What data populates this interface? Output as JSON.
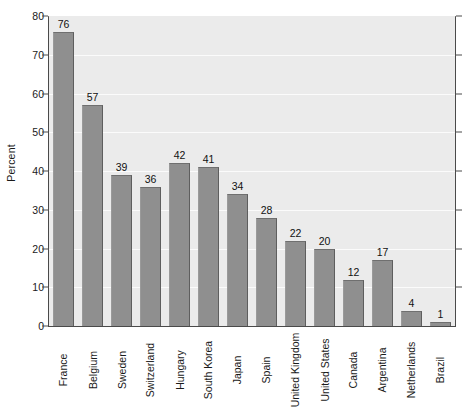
{
  "chart_data": {
    "type": "bar",
    "title": "",
    "subtitle": "",
    "xlabel": "",
    "ylabel": "Percent",
    "ylim": [
      0,
      80
    ],
    "yticks": [
      0,
      10,
      20,
      30,
      40,
      50,
      60,
      70,
      80
    ],
    "grid": true,
    "legend": null,
    "orientation": "vertical",
    "bar_color": "#8f8f8f",
    "plot_background": "#ebebeb",
    "gridline_color": "#fbfbfb",
    "axis_color": "#4a4a4a",
    "x_tick_label_rotation": 90,
    "value_labels_shown": true,
    "categories": [
      "France",
      "Belgium",
      "Sweden",
      "Switzerland",
      "Hungary",
      "South Korea",
      "Japan",
      "Spain",
      "United Kingdom",
      "United States",
      "Canada",
      "Argentina",
      "Netherlands",
      "Brazil"
    ],
    "values": [
      76,
      57,
      39,
      36,
      42,
      41,
      34,
      28,
      22,
      20,
      12,
      17,
      4,
      1
    ]
  }
}
